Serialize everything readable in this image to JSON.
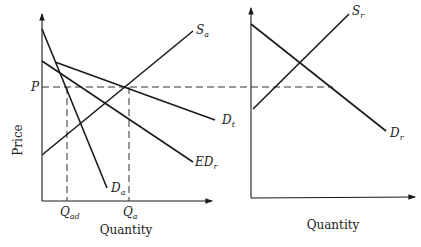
{
  "left_panel": {
    "y_axis_label": "Price",
    "x_axis_label": "Quantity",
    "price_level_label": "P",
    "quantity_labels": {
      "q_ad": {
        "main": "Q",
        "sub": "ad"
      },
      "q_a": {
        "main": "Q",
        "sub": "a"
      }
    },
    "curves": {
      "supply": {
        "main": "S",
        "sub": "a"
      },
      "domestic_demand": {
        "main": "D",
        "sub": "a"
      },
      "excess_demand": {
        "main": "ED",
        "sub": "r"
      },
      "total_demand": {
        "main": "D",
        "sub": "t"
      }
    }
  },
  "right_panel": {
    "x_axis_label": "Quantity",
    "curves": {
      "supply": {
        "main": "S",
        "sub": "r"
      },
      "demand": {
        "main": "D",
        "sub": "r"
      }
    }
  }
}
